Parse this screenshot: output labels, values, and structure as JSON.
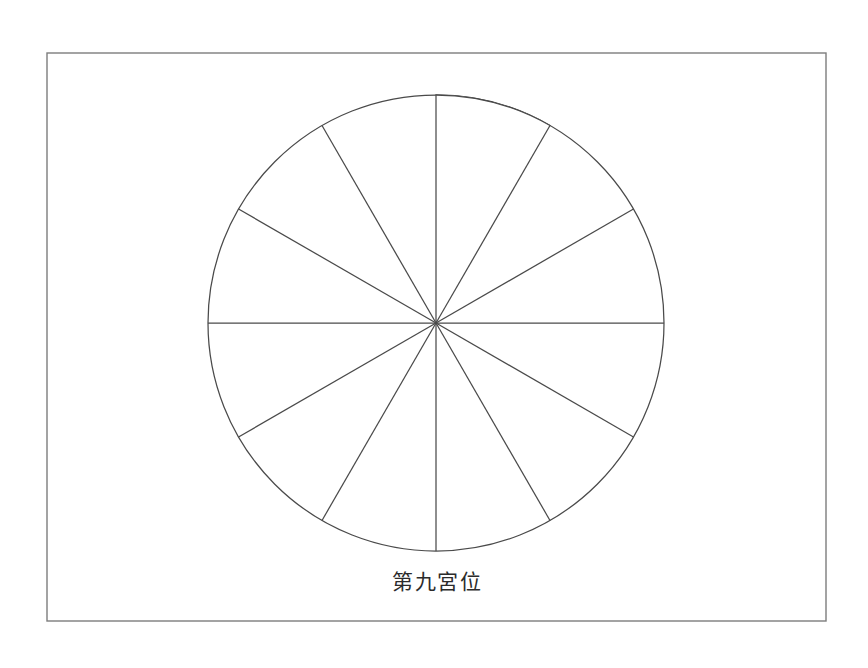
{
  "figure": {
    "caption": "第九宮位",
    "background_color": "#ffffff",
    "frame": {
      "x": 47,
      "y": 53,
      "width": 779,
      "height": 568,
      "stroke_color": "#7d7d7d",
      "fill_color": "#ffffff"
    }
  },
  "chart_data": {
    "type": "pie",
    "title": "第九宮位",
    "subtitle": "",
    "xlabel": "",
    "ylabel": "",
    "legend_position": "none",
    "grid": false,
    "center_x": 436,
    "center_y": 323,
    "radius": 228,
    "slice_count": 12,
    "slice_angle_degrees": 30,
    "start_angle_degrees": 0,
    "direction": "clockwise",
    "line_color": "#4a4a4a",
    "highlight_color": "#a9a9a9",
    "unfilled_color": "#ffffff",
    "categories": [
      "宮位 1",
      "宮位 2",
      "宮位 3",
      "宮位 4",
      "宮位 5",
      "宮位 6",
      "宮位 7",
      "宮位 8",
      "宮位 9",
      "宮位 10",
      "宮位 11",
      "宮位 12"
    ],
    "values": [
      30,
      30,
      30,
      30,
      30,
      30,
      30,
      30,
      30,
      30,
      30,
      30
    ],
    "slices": [
      {
        "index": 1,
        "start_deg": 0,
        "end_deg": 30,
        "value": 30,
        "highlighted": true,
        "fill": "#a9a9a9"
      },
      {
        "index": 2,
        "start_deg": 30,
        "end_deg": 60,
        "value": 30,
        "highlighted": false,
        "fill": "#ffffff"
      },
      {
        "index": 3,
        "start_deg": 60,
        "end_deg": 90,
        "value": 30,
        "highlighted": false,
        "fill": "#ffffff"
      },
      {
        "index": 4,
        "start_deg": 90,
        "end_deg": 120,
        "value": 30,
        "highlighted": false,
        "fill": "#ffffff"
      },
      {
        "index": 5,
        "start_deg": 120,
        "end_deg": 150,
        "value": 30,
        "highlighted": false,
        "fill": "#ffffff"
      },
      {
        "index": 6,
        "start_deg": 150,
        "end_deg": 180,
        "value": 30,
        "highlighted": false,
        "fill": "#ffffff"
      },
      {
        "index": 7,
        "start_deg": 180,
        "end_deg": 210,
        "value": 30,
        "highlighted": false,
        "fill": "#ffffff"
      },
      {
        "index": 8,
        "start_deg": 210,
        "end_deg": 240,
        "value": 30,
        "highlighted": false,
        "fill": "#ffffff"
      },
      {
        "index": 9,
        "start_deg": 240,
        "end_deg": 270,
        "value": 30,
        "highlighted": false,
        "fill": "#ffffff"
      },
      {
        "index": 10,
        "start_deg": 270,
        "end_deg": 300,
        "value": 30,
        "highlighted": false,
        "fill": "#ffffff"
      },
      {
        "index": 11,
        "start_deg": 300,
        "end_deg": 330,
        "value": 30,
        "highlighted": false,
        "fill": "#ffffff"
      },
      {
        "index": 12,
        "start_deg": 330,
        "end_deg": 360,
        "value": 30,
        "highlighted": false,
        "fill": "#ffffff"
      }
    ],
    "annotations": [
      {
        "name": "caption",
        "text": "第九宮位",
        "x": 437,
        "y": 589
      }
    ]
  }
}
